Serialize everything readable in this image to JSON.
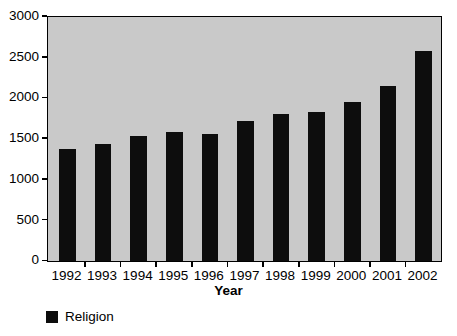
{
  "chart_data": {
    "type": "bar",
    "title": "",
    "xlabel": "Year",
    "ylabel": "",
    "categories": [
      "1992",
      "1993",
      "1994",
      "1995",
      "1996",
      "1997",
      "1998",
      "1999",
      "2000",
      "2001",
      "2002"
    ],
    "series": [
      {
        "name": "Religion",
        "values": [
          1380,
          1440,
          1540,
          1580,
          1560,
          1720,
          1800,
          1830,
          1950,
          2150,
          2580
        ]
      }
    ],
    "ylim": [
      0,
      3000
    ],
    "y_ticks": [
      0,
      500,
      1000,
      1500,
      2000,
      2500,
      3000
    ],
    "y_tick_labels": [
      "0",
      "500",
      "1000",
      "1500",
      "2000",
      "2500",
      "3000"
    ],
    "grid": false,
    "legend_position": "bottom-left",
    "colors": {
      "bar": "#0d0d0d",
      "plot_background": "#c9c9c9",
      "figure_background": "#ffffff",
      "axis": "#000000",
      "text": "#000000"
    }
  },
  "legend": {
    "entries": [
      {
        "label": "Religion",
        "color": "#0d0d0d"
      }
    ]
  }
}
